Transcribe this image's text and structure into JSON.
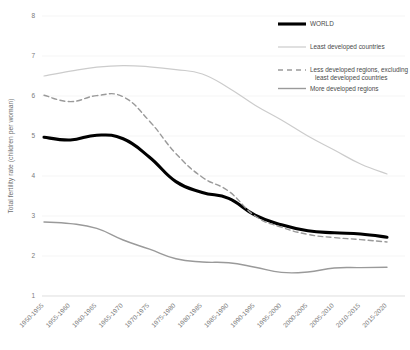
{
  "chart_data": {
    "type": "line",
    "title": "",
    "xlabel": "",
    "ylabel": "Total fertility rate (children per woman)",
    "ylim": [
      1,
      8
    ],
    "yticks": [
      1,
      2,
      3,
      4,
      5,
      6,
      7,
      8
    ],
    "grid": true,
    "legend_position": "top-right",
    "categories": [
      "1950-1955",
      "1955-1960",
      "1960-1965",
      "1965-1970",
      "1970-1975",
      "1975-1980",
      "1980-1985",
      "1985-1990",
      "1990-1995",
      "1995-2000",
      "2000-2005",
      "2005-2010",
      "2010-2015",
      "2015-2020"
    ],
    "series": [
      {
        "name": "WORLD",
        "color": "#000000",
        "style": "solid",
        "width": 3.1,
        "values": [
          4.97,
          4.9,
          5.02,
          4.93,
          4.47,
          3.86,
          3.59,
          3.44,
          3.02,
          2.78,
          2.63,
          2.58,
          2.55,
          2.47
        ]
      },
      {
        "name": "Least developed countries",
        "color": "#cccccc",
        "style": "solid",
        "width": 1.2,
        "values": [
          6.5,
          6.62,
          6.72,
          6.76,
          6.73,
          6.66,
          6.55,
          6.2,
          5.77,
          5.4,
          5.0,
          4.65,
          4.3,
          4.05
        ]
      },
      {
        "name": "Less developed regions, excluding least developed countries",
        "color": "#9a9a9a",
        "style": "dashed",
        "width": 1.4,
        "values": [
          6.02,
          5.86,
          6.01,
          5.98,
          5.37,
          4.56,
          3.97,
          3.62,
          3.0,
          2.72,
          2.54,
          2.46,
          2.41,
          2.35
        ]
      },
      {
        "name": "More developed regions",
        "color": "#9a9a9a",
        "style": "solid",
        "width": 1.4,
        "values": [
          2.85,
          2.81,
          2.69,
          2.4,
          2.17,
          1.93,
          1.85,
          1.83,
          1.72,
          1.59,
          1.6,
          1.7,
          1.71,
          1.72
        ]
      }
    ]
  },
  "legend": {
    "items": [
      {
        "label": "WORLD"
      },
      {
        "label": "Least developed countries"
      },
      {
        "label": "Less developed regions, excluding"
      },
      {
        "label": "least developed countries"
      },
      {
        "label": "More developed regions"
      }
    ]
  },
  "yaxis": {
    "title": "Total fertility rate (children per woman)",
    "ticks": [
      "8",
      "7",
      "6",
      "5",
      "4",
      "3",
      "2",
      "1"
    ]
  }
}
